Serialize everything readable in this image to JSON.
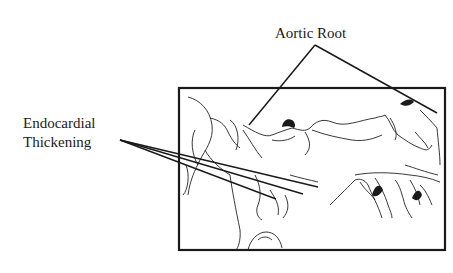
{
  "diagram": {
    "labels": {
      "aortic_root": "Aortic Root",
      "endocardial_line1": "Endocardial",
      "endocardial_line2": "Thickening"
    },
    "colors": {
      "ink": "#1a1a1a",
      "background": "#ffffff"
    }
  }
}
